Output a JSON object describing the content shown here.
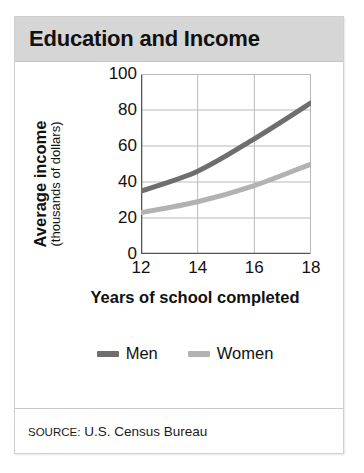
{
  "figure": {
    "title": "Education and Income",
    "source_prefix": "SOURCE:",
    "source_text": "U.S. Census Bureau",
    "header_bg": "#d6d6d6",
    "border_color": "#cfcfcf"
  },
  "chart_data": {
    "type": "line",
    "title": "Education and Income",
    "xlabel": "Years of school completed",
    "ylabel": "Average income (thousands of dollars)",
    "ylabel_main": "Average income",
    "ylabel_sub": "(thousands of dollars)",
    "x": [
      12,
      14,
      16,
      18
    ],
    "xticks": [
      "12",
      "14",
      "16",
      "18"
    ],
    "yticks": [
      "0",
      "20",
      "40",
      "60",
      "80",
      "100"
    ],
    "ytick_values": [
      0,
      20,
      40,
      60,
      80,
      100
    ],
    "xlim": [
      12,
      18
    ],
    "ylim": [
      0,
      100
    ],
    "grid": true,
    "legend_position": "bottom",
    "series": [
      {
        "name": "Men",
        "values": [
          35,
          46,
          64,
          84
        ],
        "color": "#6e6e6e"
      },
      {
        "name": "Women",
        "values": [
          23,
          29,
          38,
          50
        ],
        "color": "#b2b2b2"
      }
    ]
  }
}
